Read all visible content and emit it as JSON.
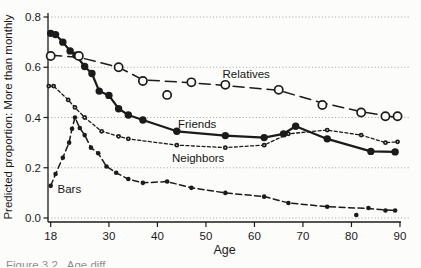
{
  "page": {
    "background": "#fcfcfa",
    "ink_color": "#1b1b1b",
    "grid_color": "#999999"
  },
  "caption_fragment": "Figure 3.2   Age diff",
  "chart_data": {
    "type": "line",
    "title": "",
    "xlabel": "Age",
    "ylabel": "Predicted proportion: More than monthly",
    "xlim": [
      17,
      91.5
    ],
    "ylim": [
      0.0,
      0.8
    ],
    "x_ticks": [
      18,
      30,
      40,
      50,
      60,
      70,
      80,
      90
    ],
    "y_ticks": [
      "0.0",
      "0.2",
      "0.4",
      "0.6",
      "0.8"
    ],
    "y_tick_values": [
      0.0,
      0.2,
      0.4,
      0.6,
      0.8
    ],
    "grid": "horizontal-dotted",
    "legend_position": "inline-labels",
    "series": [
      {
        "name": "Friends",
        "marker": "filled-circle-large",
        "line": "solid",
        "points": [
          [
            18,
            0.735
          ],
          [
            19,
            0.73
          ],
          [
            20.5,
            0.7
          ],
          [
            22,
            0.665
          ],
          [
            23.2,
            0.648
          ],
          [
            25,
            0.603
          ],
          [
            26.5,
            0.575
          ],
          [
            28,
            0.505
          ],
          [
            30,
            0.488
          ],
          [
            32,
            0.435
          ],
          [
            34,
            0.41
          ],
          [
            37,
            0.39
          ],
          [
            44,
            0.345
          ],
          [
            54,
            0.328
          ],
          [
            62,
            0.32
          ],
          [
            66,
            0.335
          ],
          [
            68.5,
            0.365
          ],
          [
            75,
            0.315
          ],
          [
            84,
            0.265
          ],
          [
            89,
            0.263
          ]
        ]
      },
      {
        "name": "Bars",
        "marker": "filled-circle-small",
        "line": "medium-dash",
        "points": [
          [
            18,
            0.128
          ],
          [
            19,
            0.175
          ],
          [
            20.5,
            0.24
          ],
          [
            21.8,
            0.3
          ],
          [
            22.4,
            0.355
          ],
          [
            23,
            0.4
          ],
          [
            24,
            0.358
          ],
          [
            25,
            0.33
          ],
          [
            26.3,
            0.28
          ],
          [
            27.8,
            0.258
          ],
          [
            29.5,
            0.205
          ],
          [
            31.5,
            0.18
          ],
          [
            34,
            0.155
          ],
          [
            37,
            0.14
          ],
          [
            42,
            0.145
          ],
          [
            47,
            0.12
          ],
          [
            54,
            0.1
          ],
          [
            62,
            0.085
          ],
          [
            67,
            0.06
          ],
          [
            75,
            0.045
          ],
          [
            81,
            0.012
          ],
          [
            83.5,
            0.04
          ],
          [
            87,
            0.03
          ],
          [
            89,
            0.03
          ]
        ],
        "line_points": [
          [
            18,
            0.128
          ],
          [
            19,
            0.175
          ],
          [
            20.5,
            0.24
          ],
          [
            21.8,
            0.3
          ],
          [
            22.4,
            0.355
          ],
          [
            23,
            0.4
          ],
          [
            24,
            0.358
          ],
          [
            25,
            0.33
          ],
          [
            26.3,
            0.28
          ],
          [
            27.8,
            0.258
          ],
          [
            29.5,
            0.205
          ],
          [
            31.5,
            0.18
          ],
          [
            34,
            0.155
          ],
          [
            37,
            0.14
          ],
          [
            42,
            0.145
          ],
          [
            47,
            0.12
          ],
          [
            54,
            0.1
          ],
          [
            62,
            0.085
          ],
          [
            67,
            0.06
          ],
          [
            75,
            0.045
          ],
          [
            83.5,
            0.038
          ],
          [
            87,
            0.032
          ],
          [
            89,
            0.03
          ]
        ]
      },
      {
        "name": "Neighbors",
        "marker": "bullseye-circle-small",
        "line": "short-dash",
        "points": [
          [
            17.6,
            0.525
          ],
          [
            18.6,
            0.525
          ],
          [
            21.6,
            0.47
          ],
          [
            23,
            0.44
          ],
          [
            25,
            0.4
          ],
          [
            28.5,
            0.345
          ],
          [
            32,
            0.325
          ],
          [
            34,
            0.315
          ],
          [
            44,
            0.29
          ],
          [
            54,
            0.28
          ],
          [
            62,
            0.29
          ],
          [
            67,
            0.335
          ],
          [
            75,
            0.35
          ],
          [
            82,
            0.33
          ],
          [
            87,
            0.3
          ],
          [
            89.5,
            0.303
          ]
        ]
      },
      {
        "name": "Relatives",
        "marker": "open-circle",
        "line": "long-dash",
        "points": [
          [
            18,
            0.645
          ],
          [
            23.8,
            0.645
          ],
          [
            32,
            0.6
          ],
          [
            37,
            0.545
          ],
          [
            42,
            0.49
          ],
          [
            47,
            0.54
          ],
          [
            54,
            0.53
          ],
          [
            65,
            0.51
          ],
          [
            74,
            0.45
          ],
          [
            82,
            0.42
          ],
          [
            87,
            0.405
          ],
          [
            89.5,
            0.405
          ]
        ],
        "line_points": [
          [
            18,
            0.648
          ],
          [
            23.8,
            0.64
          ],
          [
            32,
            0.6
          ],
          [
            37,
            0.55
          ],
          [
            47,
            0.538
          ],
          [
            54,
            0.527
          ],
          [
            65,
            0.508
          ],
          [
            74,
            0.458
          ],
          [
            82,
            0.423
          ],
          [
            89.5,
            0.4
          ]
        ]
      }
    ],
    "annotations": [
      {
        "text": "Relatives",
        "x": 58.3,
        "y": 0.575,
        "anchor": "middle"
      },
      {
        "text": "Friends",
        "x": 48.2,
        "y": 0.375,
        "anchor": "middle"
      },
      {
        "text": "Neighbors",
        "x": 48.4,
        "y": 0.238,
        "anchor": "middle"
      },
      {
        "text": "Bars",
        "x": 19.4,
        "y": 0.117,
        "anchor": "start"
      }
    ]
  }
}
